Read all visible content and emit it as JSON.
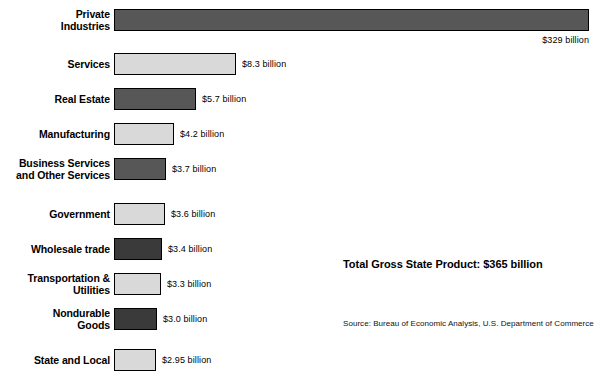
{
  "chart_data": {
    "type": "bar",
    "orientation": "horizontal",
    "title": "",
    "xlabel": "",
    "ylabel": "",
    "grid": false,
    "legend": false,
    "axis_visible": false,
    "value_unit": "billion USD",
    "xlim": [
      0,
      329
    ],
    "categories": [
      "Private Industries",
      "Services",
      "Real Estate",
      "Manufacturing",
      "Business Services and Other Services",
      "Government",
      "Wholesale trade",
      "Transportation & Utilities",
      "Nondurable Goods",
      "State and Local"
    ],
    "values": [
      329,
      8.3,
      5.7,
      4.2,
      3.7,
      3.6,
      3.4,
      3.3,
      3.0,
      2.95
    ],
    "value_labels": [
      "$329 billion",
      "$8.3 billion",
      "$5.7 billion",
      "$4.2 billion",
      "$3.7 billion",
      "$3.6 billion",
      "$3.4 billion",
      "$3.3 billion",
      "$3.0 billion",
      "$2.95 billion"
    ],
    "annotations": [
      "Total Gross State Product: $365 billion",
      "Source: Bureau of Economic Analysis, U.S. Department of Commerce"
    ]
  },
  "colors": {
    "background": "#ffffff",
    "bar_dark": "#575757",
    "bar_darker": "#3a3a3a",
    "bar_light": "#d9d9d9",
    "bar_border": "#000000",
    "text": "#000000"
  },
  "rows": [
    {
      "label_line1": "Private",
      "label_line2": "Industries",
      "value_label": "$329 billion",
      "value": 329,
      "bar_px": 475,
      "top": 9,
      "fill": "#575757",
      "label_position": "below-right"
    },
    {
      "label_line1": "Services",
      "label_line2": "",
      "value_label": "$8.3 billion",
      "value": 8.3,
      "bar_px": 122,
      "top": 53,
      "fill": "#d9d9d9",
      "label_position": "right"
    },
    {
      "label_line1": "Real Estate",
      "label_line2": "",
      "value_label": "$5.7 billion",
      "value": 5.7,
      "bar_px": 82,
      "top": 88,
      "fill": "#575757",
      "label_position": "right"
    },
    {
      "label_line1": "Manufacturing",
      "label_line2": "",
      "value_label": "$4.2 billion",
      "value": 4.2,
      "bar_px": 60,
      "top": 123,
      "fill": "#d9d9d9",
      "label_position": "right"
    },
    {
      "label_line1": "Business Services",
      "label_line2": "and Other Services",
      "value_label": "$3.7 billion",
      "value": 3.7,
      "bar_px": 52,
      "top": 158,
      "fill": "#575757",
      "label_position": "right"
    },
    {
      "label_line1": "Government",
      "label_line2": "",
      "value_label": "$3.6 billion",
      "value": 3.6,
      "bar_px": 51,
      "top": 203,
      "fill": "#d9d9d9",
      "label_position": "right"
    },
    {
      "label_line1": "Wholesale trade",
      "label_line2": "",
      "value_label": "$3.4 billion",
      "value": 3.4,
      "bar_px": 48,
      "top": 238,
      "fill": "#3a3a3a",
      "label_position": "right"
    },
    {
      "label_line1": "Transportation &",
      "label_line2": "Utilities",
      "value_label": "$3.3 billion",
      "value": 3.3,
      "bar_px": 47,
      "top": 273,
      "fill": "#d9d9d9",
      "label_position": "right"
    },
    {
      "label_line1": "Nondurable",
      "label_line2": "Goods",
      "value_label": "$3.0 billion",
      "value": 3.0,
      "bar_px": 43,
      "top": 308,
      "fill": "#3a3a3a",
      "label_position": "right"
    },
    {
      "label_line1": "State and Local",
      "label_line2": "",
      "value_label": "$2.95 billion",
      "value": 2.95,
      "bar_px": 42,
      "top": 349,
      "fill": "#d9d9d9",
      "label_position": "right"
    }
  ],
  "summary": {
    "total_label": "Total Gross State Product: $365 billion",
    "source_label": "Source: Bureau of Economic Analysis, U.S. Department of Commerce"
  }
}
